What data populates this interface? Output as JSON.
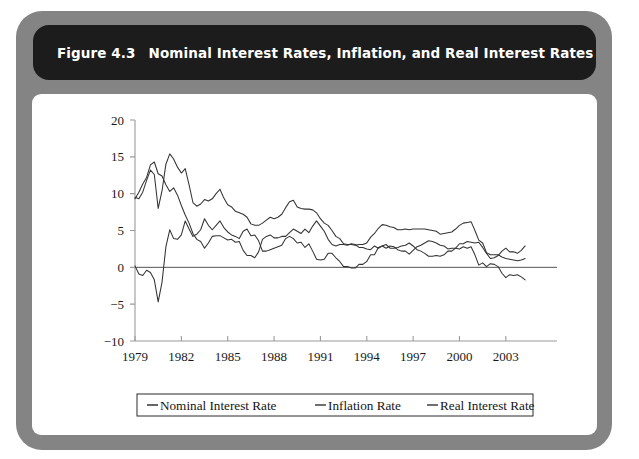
{
  "figure": {
    "number_label": "Figure 4.3",
    "title": "Nominal Interest Rates, Inflation, and Real Interest Rates",
    "title_bar_color": "#1c1c1c",
    "frame_color": "#848484",
    "panel_color": "#ffffff"
  },
  "chart_data": {
    "type": "line",
    "title": "Nominal Interest Rates, Inflation, and Real Interest Rates",
    "xlabel": "",
    "ylabel": "",
    "xlim": [
      1979,
      2004.5
    ],
    "ylim": [
      -10,
      20
    ],
    "xticks": [
      1979,
      1982,
      1985,
      1988,
      1991,
      1994,
      1997,
      2000,
      2003
    ],
    "xtick_labels": [
      "1979",
      "1982",
      "1985",
      "1988",
      "1991",
      "1994",
      "1997",
      "2000",
      "2003"
    ],
    "yticks": [
      -10,
      -5,
      0,
      5,
      10,
      15,
      20
    ],
    "ytick_labels": [
      "−10",
      "−5",
      "0",
      "5",
      "10",
      "15",
      "20"
    ],
    "grid": false,
    "zero_line": true,
    "legend_position": "below",
    "legend_entries": [
      "Nominal Interest Rate",
      "Inflation Rate",
      "Real Interest Rate"
    ],
    "line_color": "#333333",
    "x": [
      1979.0,
      1979.25,
      1979.5,
      1979.75,
      1980.0,
      1980.25,
      1980.5,
      1980.75,
      1981.0,
      1981.25,
      1981.5,
      1981.75,
      1982.0,
      1982.25,
      1982.5,
      1982.75,
      1983.0,
      1983.25,
      1983.5,
      1983.75,
      1984.0,
      1984.25,
      1984.5,
      1984.75,
      1985.0,
      1985.25,
      1985.5,
      1985.75,
      1986.0,
      1986.25,
      1986.5,
      1986.75,
      1987.0,
      1987.25,
      1987.5,
      1987.75,
      1988.0,
      1988.25,
      1988.5,
      1988.75,
      1989.0,
      1989.25,
      1989.5,
      1989.75,
      1990.0,
      1990.25,
      1990.5,
      1990.75,
      1991.0,
      1991.25,
      1991.5,
      1991.75,
      1992.0,
      1992.25,
      1992.5,
      1992.75,
      1993.0,
      1993.25,
      1993.5,
      1993.75,
      1994.0,
      1994.25,
      1994.5,
      1994.75,
      1995.0,
      1995.25,
      1995.5,
      1995.75,
      1996.0,
      1996.25,
      1996.5,
      1996.75,
      1997.0,
      1997.25,
      1997.5,
      1997.75,
      1998.0,
      1998.25,
      1998.5,
      1998.75,
      1999.0,
      1999.25,
      1999.5,
      1999.75,
      2000.0,
      2000.25,
      2000.5,
      2000.75,
      2001.0,
      2001.25,
      2001.5,
      2001.75,
      2002.0,
      2002.25,
      2002.5,
      2002.75,
      2003.0,
      2003.25,
      2003.5,
      2003.75,
      2004.0,
      2004.25
    ],
    "series": [
      {
        "name": "Nominal Interest Rate",
        "values": [
          9.5,
          9.3,
          10.2,
          11.8,
          13.2,
          12.6,
          8.0,
          10.4,
          14.0,
          15.4,
          14.7,
          13.6,
          12.8,
          13.4,
          11.2,
          8.8,
          8.3,
          8.6,
          9.2,
          9.0,
          9.3,
          10.0,
          10.6,
          9.4,
          8.5,
          8.2,
          7.6,
          7.4,
          7.2,
          6.8,
          5.9,
          5.7,
          5.7,
          6.0,
          6.4,
          6.8,
          6.6,
          6.8,
          7.2,
          8.1,
          8.9,
          9.1,
          8.2,
          8.0,
          7.9,
          7.9,
          7.8,
          7.4,
          6.6,
          6.0,
          5.7,
          5.0,
          4.2,
          3.9,
          3.2,
          3.1,
          3.1,
          3.0,
          3.1,
          3.1,
          3.3,
          4.1,
          4.6,
          5.3,
          5.8,
          5.7,
          5.5,
          5.4,
          5.1,
          5.1,
          5.2,
          5.1,
          5.2,
          5.2,
          5.2,
          5.2,
          5.1,
          5.0,
          4.9,
          4.5,
          4.6,
          4.7,
          4.8,
          5.2,
          5.7,
          6.0,
          6.1,
          6.2,
          5.0,
          3.7,
          3.3,
          2.0,
          1.7,
          1.7,
          1.7,
          1.4,
          1.2,
          1.1,
          1.0,
          0.9,
          1.0,
          1.2
        ]
      },
      {
        "name": "Inflation Rate",
        "values": [
          9.3,
          10.2,
          11.3,
          12.2,
          13.9,
          14.3,
          12.7,
          12.4,
          11.2,
          10.3,
          10.8,
          9.8,
          8.4,
          7.1,
          6.0,
          4.6,
          3.8,
          3.5,
          2.6,
          3.3,
          4.2,
          4.3,
          4.3,
          4.0,
          3.7,
          3.8,
          3.4,
          3.5,
          2.3,
          1.6,
          1.6,
          1.3,
          2.1,
          3.8,
          4.2,
          4.4,
          4.0,
          4.0,
          4.2,
          4.2,
          4.7,
          5.2,
          4.9,
          4.6,
          5.2,
          4.7,
          5.6,
          6.3,
          5.6,
          4.9,
          3.8,
          3.1,
          2.9,
          3.1,
          3.1,
          3.0,
          3.2,
          3.1,
          2.7,
          2.7,
          2.5,
          2.4,
          2.9,
          2.6,
          2.9,
          3.1,
          2.6,
          2.6,
          2.7,
          2.9,
          3.0,
          3.3,
          2.9,
          2.4,
          2.2,
          1.9,
          1.5,
          1.5,
          1.6,
          1.5,
          1.7,
          2.2,
          2.2,
          2.6,
          3.2,
          3.2,
          3.5,
          3.4,
          3.3,
          3.4,
          2.7,
          1.9,
          1.2,
          1.3,
          1.6,
          2.2,
          2.6,
          2.1,
          2.1,
          1.9,
          2.3,
          2.9
        ]
      },
      {
        "name": "Real Interest Rate",
        "values": [
          0.2,
          -0.9,
          -1.1,
          -0.4,
          -0.7,
          -1.7,
          -4.7,
          -2.0,
          2.8,
          5.1,
          3.9,
          3.8,
          4.4,
          6.3,
          5.2,
          4.2,
          4.5,
          5.1,
          6.6,
          5.7,
          5.1,
          5.7,
          6.3,
          5.4,
          4.8,
          4.4,
          4.2,
          3.9,
          4.9,
          5.2,
          4.3,
          4.4,
          3.6,
          2.2,
          2.2,
          2.4,
          2.6,
          2.8,
          3.0,
          3.9,
          4.2,
          3.9,
          3.3,
          3.4,
          2.7,
          3.2,
          2.2,
          1.1,
          1.0,
          1.1,
          1.9,
          1.9,
          1.3,
          0.8,
          0.1,
          0.1,
          -0.1,
          -0.1,
          0.4,
          0.4,
          0.8,
          1.7,
          1.7,
          2.7,
          2.9,
          2.6,
          2.9,
          2.8,
          2.4,
          2.2,
          2.2,
          1.8,
          2.3,
          2.8,
          3.0,
          3.3,
          3.6,
          3.5,
          3.3,
          3.0,
          2.9,
          2.5,
          2.6,
          2.6,
          2.5,
          2.8,
          2.6,
          2.8,
          1.7,
          0.3,
          0.6,
          0.1,
          0.5,
          0.4,
          0.1,
          -0.8,
          -1.4,
          -1.0,
          -1.1,
          -1.0,
          -1.3,
          -1.7
        ]
      }
    ]
  }
}
